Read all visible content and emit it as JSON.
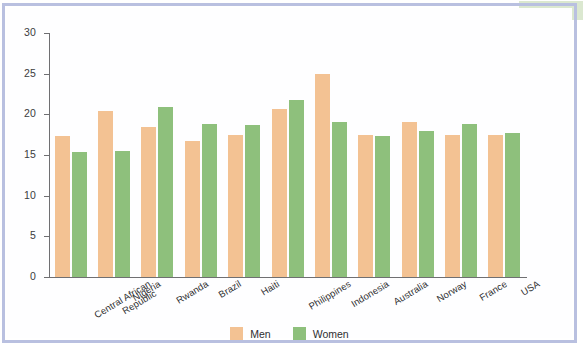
{
  "chart_data": {
    "type": "bar",
    "title": "",
    "xlabel": "",
    "ylabel": "",
    "ylim": [
      0,
      30
    ],
    "yticks": [
      0,
      5,
      10,
      15,
      20,
      25,
      30
    ],
    "grid": false,
    "legend_position": "bottom-center",
    "categories": [
      "Central African Republic",
      "Nigeria",
      "Rwanda",
      "Brazil",
      "Haiti",
      "Philippines",
      "Indonesia",
      "Australia",
      "Norway",
      "France",
      "USA"
    ],
    "series": [
      {
        "name": "Men",
        "color": "#f3c293",
        "values": [
          17.3,
          20.4,
          18.5,
          16.7,
          17.5,
          20.6,
          25.0,
          17.4,
          19.0,
          17.4,
          17.4
        ]
      },
      {
        "name": "Women",
        "color": "#8ec07c",
        "values": [
          15.4,
          15.5,
          20.9,
          18.8,
          18.7,
          21.8,
          19.0,
          17.3,
          17.9,
          18.8,
          17.7
        ]
      }
    ]
  },
  "legend": {
    "items": [
      {
        "label": "Men",
        "color": "#f3c293"
      },
      {
        "label": "Women",
        "color": "#8ec07c"
      }
    ]
  },
  "frame": {
    "border_color": "#b9c0e0",
    "highlight_patch_color": "#cfe0c0"
  }
}
